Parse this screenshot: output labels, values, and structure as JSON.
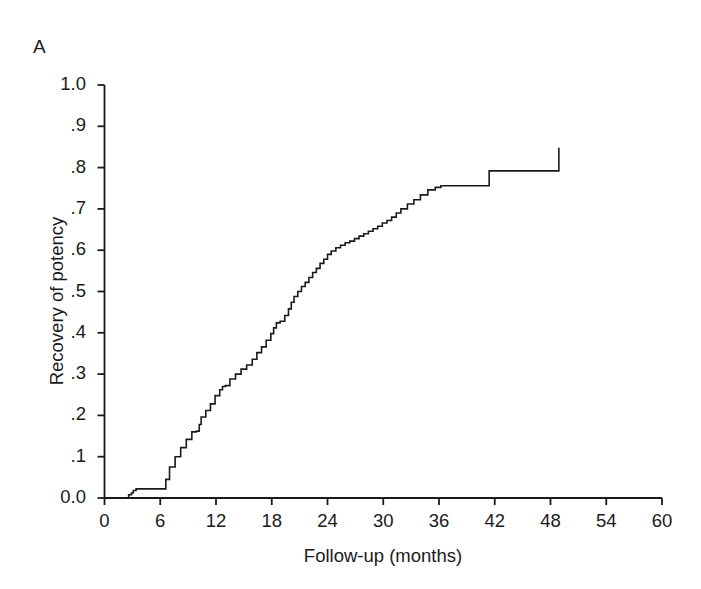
{
  "panel": {
    "label": "A"
  },
  "chart_data": {
    "type": "line",
    "subtype": "kaplan-meier-step",
    "title": "",
    "panel_label": "A",
    "xlabel": "Follow-up (months)",
    "ylabel": "Recovery of potency",
    "xlim": [
      0,
      60
    ],
    "ylim": [
      0,
      1.0
    ],
    "grid": false,
    "legend": "none",
    "line_color": "#1a1a1a",
    "line_width": 1.6,
    "xticks": [
      0,
      6,
      12,
      18,
      24,
      30,
      36,
      42,
      48,
      54,
      60
    ],
    "xtick_labels": [
      "0",
      "6",
      "12",
      "18",
      "24",
      "30",
      "36",
      "42",
      "48",
      "54",
      "60"
    ],
    "yticks": [
      0.0,
      0.1,
      0.2,
      0.3,
      0.4,
      0.5,
      0.6,
      0.7,
      0.8,
      0.9,
      1.0
    ],
    "ytick_labels": [
      "0.0",
      ".1",
      ".2",
      ".3",
      ".4",
      ".5",
      ".6",
      ".7",
      ".8",
      ".9",
      "1.0"
    ],
    "series": [
      {
        "name": "Recovery of potency",
        "x": [
          0,
          2.4,
          2.6,
          2.9,
          3.1,
          3.4,
          6.2,
          6.6,
          7.0,
          7.6,
          8.2,
          8.8,
          9.4,
          9.9,
          10.2,
          10.4,
          10.9,
          11.4,
          11.9,
          12.4,
          12.7,
          13.0,
          13.5,
          14.1,
          14.7,
          15.3,
          15.9,
          16.4,
          16.9,
          17.4,
          17.9,
          18.2,
          18.5,
          18.9,
          19.4,
          19.8,
          20.1,
          20.4,
          20.8,
          21.2,
          21.6,
          22.0,
          22.4,
          22.8,
          23.2,
          23.6,
          24.0,
          24.4,
          24.9,
          25.4,
          25.9,
          26.4,
          26.9,
          27.4,
          27.9,
          28.4,
          28.9,
          29.4,
          29.9,
          30.4,
          30.9,
          31.4,
          31.9,
          32.6,
          33.3,
          34.0,
          34.8,
          35.6,
          36.2,
          40.8,
          41.4,
          47.2,
          48.9
        ],
        "y": [
          0.0,
          0.0,
          0.008,
          0.012,
          0.018,
          0.022,
          0.022,
          0.045,
          0.075,
          0.1,
          0.122,
          0.142,
          0.16,
          0.162,
          0.178,
          0.196,
          0.212,
          0.228,
          0.248,
          0.262,
          0.27,
          0.272,
          0.288,
          0.3,
          0.312,
          0.322,
          0.336,
          0.352,
          0.366,
          0.382,
          0.398,
          0.412,
          0.424,
          0.428,
          0.442,
          0.458,
          0.474,
          0.488,
          0.5,
          0.512,
          0.522,
          0.534,
          0.546,
          0.556,
          0.568,
          0.578,
          0.59,
          0.598,
          0.606,
          0.612,
          0.618,
          0.622,
          0.628,
          0.634,
          0.64,
          0.646,
          0.652,
          0.658,
          0.666,
          0.672,
          0.68,
          0.69,
          0.7,
          0.712,
          0.722,
          0.734,
          0.746,
          0.752,
          0.756,
          0.756,
          0.792,
          0.792,
          0.848
        ],
        "final_value": 0.848,
        "max_followup_months": 48.9
      }
    ],
    "axes_style": {
      "top_spine": false,
      "right_spine": false,
      "left_spine": true,
      "bottom_spine": true,
      "tick_direction": "out"
    }
  }
}
